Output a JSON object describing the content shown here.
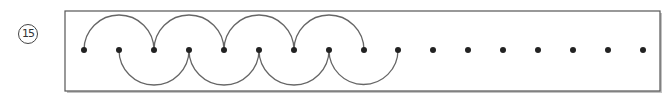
{
  "problem": {
    "number": "15"
  },
  "diagram": {
    "frame": {
      "x": 65,
      "y": 11,
      "width": 595,
      "height": 80,
      "stroke": "#555555",
      "shadow": "#999999"
    },
    "dot_row_y": 50,
    "dot_radius": 3,
    "dot_color": "#222222",
    "arc_color": "#666666",
    "dots_x": [
      84,
      119,
      154,
      189,
      224,
      259,
      294,
      329,
      364,
      398,
      433,
      468,
      503,
      538,
      573,
      608,
      643
    ],
    "upper_arcs": [
      [
        84,
        154
      ],
      [
        154,
        224
      ],
      [
        224,
        294
      ],
      [
        294,
        364
      ]
    ],
    "lower_arcs": [
      [
        119,
        189
      ],
      [
        189,
        259
      ],
      [
        259,
        329
      ],
      [
        329,
        398
      ]
    ]
  }
}
